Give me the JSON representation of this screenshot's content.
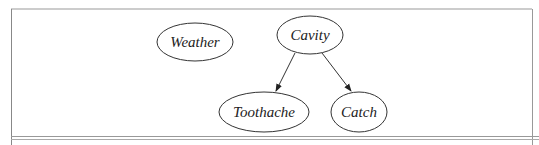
{
  "diagram": {
    "type": "bayesian-network",
    "nodes": [
      {
        "id": "weather",
        "label": "Weather",
        "cx": 195,
        "cy": 42,
        "rx": 38,
        "ry": 19
      },
      {
        "id": "cavity",
        "label": "Cavity",
        "cx": 310,
        "cy": 35,
        "rx": 33,
        "ry": 19
      },
      {
        "id": "toothache",
        "label": "Toothache",
        "cx": 264,
        "cy": 112,
        "rx": 45,
        "ry": 20
      },
      {
        "id": "catch",
        "label": "Catch",
        "cx": 359,
        "cy": 112,
        "rx": 28,
        "ry": 20
      }
    ],
    "edges": [
      {
        "from": "cavity",
        "to": "toothache"
      },
      {
        "from": "cavity",
        "to": "catch"
      }
    ],
    "colors": {
      "stroke": "#333333",
      "frame": "#888888"
    }
  }
}
